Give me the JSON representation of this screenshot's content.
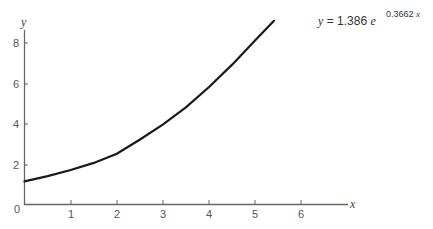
{
  "chart_data": {
    "type": "line",
    "title": "",
    "xlabel": "x",
    "ylabel": "y",
    "xlim": [
      0,
      6.9
    ],
    "ylim": [
      0,
      8.9
    ],
    "x_ticks": [
      "1",
      "2",
      "3",
      "4",
      "5",
      "6"
    ],
    "y_ticks": [
      "0",
      "2",
      "4",
      "6",
      "8"
    ],
    "grid": false,
    "legend": null,
    "annotation": {
      "text": "y = 1.386 e^(0.3662 x)",
      "lhs": "y",
      "equals": "=",
      "coefficient": "1.386",
      "base": "e",
      "exponent": "0.3662",
      "exponent_var": "x",
      "position": "top-right"
    },
    "series": [
      {
        "name": "y = 1.386 e^(0.3662 x)",
        "x": [
          0,
          0.5,
          1,
          1.5,
          2,
          2.5,
          3,
          3.5,
          4,
          4.5,
          5,
          5.4
        ],
        "y": [
          1.14,
          1.4,
          1.7,
          2.05,
          2.5,
          3.2,
          3.95,
          4.8,
          5.8,
          6.9,
          8.1,
          9.05
        ]
      }
    ]
  }
}
